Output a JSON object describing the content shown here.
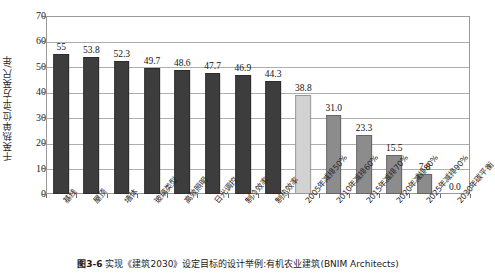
{
  "chart_data": {
    "type": "bar",
    "title": "",
    "xlabel": "",
    "ylabel": "千英热单位/平方英尺/年",
    "ylim": [
      0,
      70
    ],
    "ytick_step": 10,
    "yticks": [
      "0",
      "10",
      "20",
      "30",
      "40",
      "50",
      "60",
      "70"
    ],
    "grid": true,
    "legend": "none",
    "categories": [
      "基线",
      "屋顶",
      "墙体",
      "玻璃类型",
      "高效照明",
      "日光调控",
      "制冷效率",
      "制热效率",
      "2005年减排50%",
      "2010年减排60%",
      "2015年减排70%",
      "2020年减排80%",
      "2025年减排90%",
      "2030年碳平衡"
    ],
    "values": [
      55,
      53.8,
      52.3,
      49.7,
      48.6,
      47.7,
      46.9,
      44.3,
      38.8,
      31.0,
      23.3,
      15.5,
      7.8,
      0.0
    ],
    "value_labels": [
      "55",
      "53.8",
      "52.3",
      "49.7",
      "48.6",
      "47.7",
      "46.9",
      "44.3",
      "38.8",
      "31.0",
      "23.3",
      "15.5",
      "7.8",
      "0.0"
    ],
    "bar_colors": [
      "#3d3d3d",
      "#3d3d3d",
      "#3d3d3d",
      "#3d3d3d",
      "#3d3d3d",
      "#3d3d3d",
      "#3d3d3d",
      "#3d3d3d",
      "#d2d2d2",
      "#8c8c8c",
      "#8c8c8c",
      "#8c8c8c",
      "#8c8c8c",
      "#8c8c8c"
    ]
  },
  "colors": {
    "bar_dark": "#3d3d3d",
    "bar_light": "#d2d2d2",
    "bar_medium": "#8c8c8c",
    "gridline": "#aeaeae",
    "frame": "#9a9a9a",
    "text": "#1a1a1a"
  },
  "caption": {
    "figure_number": "图3-6",
    "text": "实现《建筑2030》设定目标的设计举例:有机农业建筑(BNIM Architects)"
  }
}
